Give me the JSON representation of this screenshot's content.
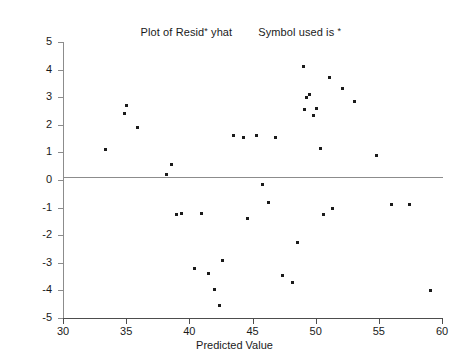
{
  "title": {
    "left": "Plot of Resid",
    "left_symbol": "*",
    "left_tail": "yhat",
    "right": "Symbol used is",
    "right_symbol": "*"
  },
  "chart_data": {
    "type": "scatter",
    "xlabel": "Predicted Value",
    "ylabel": "Residuals",
    "xlim": [
      30,
      60
    ],
    "ylim": [
      -5,
      5
    ],
    "xticks": [
      30,
      35,
      40,
      45,
      50,
      55,
      60
    ],
    "yticks": [
      5,
      4,
      3,
      2,
      1,
      0,
      -1,
      -2,
      -3,
      -4,
      -5
    ],
    "grid": false,
    "legend": null,
    "marker": "square",
    "marker_color": "#1b1b1b",
    "reference_line": {
      "orientation": "horizontal",
      "y": 0,
      "color": "#8c8c8c"
    },
    "x": [
      33.4,
      34.9,
      35.0,
      35.9,
      38.2,
      38.6,
      39.0,
      39.4,
      40.4,
      41.0,
      41.5,
      42.0,
      42.4,
      42.6,
      43.5,
      44.3,
      44.6,
      45.3,
      45.8,
      46.3,
      46.8,
      47.4,
      48.2,
      48.6,
      49.0,
      49.1,
      49.3,
      49.5,
      49.8,
      50.1,
      50.4,
      50.6,
      51.1,
      51.3,
      52.1,
      53.1,
      54.8,
      56.0,
      57.4,
      59.1
    ],
    "y": [
      1.1,
      2.4,
      2.7,
      1.9,
      0.2,
      0.55,
      -1.25,
      -1.2,
      -3.2,
      -1.2,
      -3.4,
      -3.95,
      -4.55,
      -2.9,
      1.6,
      1.55,
      -1.4,
      1.6,
      -0.15,
      -0.8,
      1.55,
      -3.45,
      -3.7,
      -2.25,
      4.1,
      2.55,
      3.0,
      3.1,
      2.35,
      2.6,
      1.15,
      -1.25,
      3.7,
      -1.05,
      3.3,
      2.85,
      0.9,
      -0.9,
      -0.9,
      -4.0
    ],
    "points": [
      {
        "x": 33.4,
        "y": 1.1
      },
      {
        "x": 34.9,
        "y": 2.4
      },
      {
        "x": 35.0,
        "y": 2.7
      },
      {
        "x": 35.9,
        "y": 1.9
      },
      {
        "x": 38.2,
        "y": 0.2
      },
      {
        "x": 38.6,
        "y": 0.55
      },
      {
        "x": 39.0,
        "y": -1.25
      },
      {
        "x": 39.4,
        "y": -1.2
      },
      {
        "x": 40.4,
        "y": -3.2
      },
      {
        "x": 41.0,
        "y": -1.2
      },
      {
        "x": 41.5,
        "y": -3.4
      },
      {
        "x": 42.0,
        "y": -3.95
      },
      {
        "x": 42.4,
        "y": -4.55
      },
      {
        "x": 42.6,
        "y": -2.9
      },
      {
        "x": 43.5,
        "y": 1.6
      },
      {
        "x": 44.3,
        "y": 1.55
      },
      {
        "x": 44.6,
        "y": -1.4
      },
      {
        "x": 45.3,
        "y": 1.6
      },
      {
        "x": 45.8,
        "y": -0.15
      },
      {
        "x": 46.3,
        "y": -0.8
      },
      {
        "x": 46.8,
        "y": 1.55
      },
      {
        "x": 47.4,
        "y": -3.45
      },
      {
        "x": 48.2,
        "y": -3.7
      },
      {
        "x": 48.6,
        "y": -2.25
      },
      {
        "x": 49.0,
        "y": 4.1
      },
      {
        "x": 49.1,
        "y": 2.55
      },
      {
        "x": 49.3,
        "y": 3.0
      },
      {
        "x": 49.5,
        "y": 3.1
      },
      {
        "x": 49.8,
        "y": 2.35
      },
      {
        "x": 50.1,
        "y": 2.6
      },
      {
        "x": 50.4,
        "y": 1.15
      },
      {
        "x": 50.6,
        "y": -1.25
      },
      {
        "x": 51.1,
        "y": 3.7
      },
      {
        "x": 51.3,
        "y": -1.05
      },
      {
        "x": 52.1,
        "y": 3.3
      },
      {
        "x": 53.1,
        "y": 2.85
      },
      {
        "x": 54.8,
        "y": 0.9
      },
      {
        "x": 56.0,
        "y": -0.9
      },
      {
        "x": 57.4,
        "y": -0.9
      },
      {
        "x": 59.1,
        "y": -4.0
      }
    ]
  }
}
